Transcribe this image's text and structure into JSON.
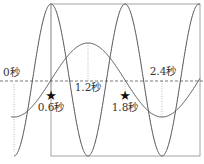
{
  "diagram": {
    "type": "wave-comparison",
    "colors": {
      "curve": "#555555",
      "frame": "#888888",
      "axis": "#555555",
      "guide": "#aaaaaa",
      "star": "#111111",
      "text": "#333333"
    },
    "time_labels": {
      "t0": "0秒",
      "t06": "0.6秒",
      "t12": "1.2秒",
      "t18": "1.8秒",
      "t24": "2.4秒"
    },
    "markers": [
      {
        "icon": "star-icon",
        "label": "0.6秒"
      },
      {
        "icon": "star-icon",
        "label": "1.8秒"
      }
    ],
    "waves": [
      {
        "name": "fast-wave",
        "period_s": 1.2,
        "phase": "trough at 0秒",
        "relative_amplitude": 1.0
      },
      {
        "name": "slow-wave",
        "period_s": 2.4,
        "phase": "trough at 0秒",
        "relative_amplitude": 0.49
      }
    ]
  }
}
